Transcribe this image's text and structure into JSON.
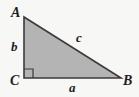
{
  "figure": {
    "kind": "right-triangle-diagram",
    "canvas": {
      "width": 139,
      "height": 97
    },
    "colors": {
      "background": "#f7f7f5",
      "triangle_fill": "#b4b4b4",
      "triangle_stroke": "#3a3a3a",
      "right_angle_stroke": "#3a3a3a",
      "label_text": "#1d1d1d"
    },
    "vertices": [
      {
        "name": "A",
        "label": "A",
        "x": 24,
        "y": 17,
        "position": "top-left-apex"
      },
      {
        "name": "B",
        "label": "B",
        "x": 121,
        "y": 78,
        "position": "bottom-right"
      },
      {
        "name": "C",
        "label": "C",
        "x": 24,
        "y": 78,
        "position": "bottom-left-right-angle"
      }
    ],
    "sides": [
      {
        "name": "a",
        "label": "a",
        "between": "C-B",
        "role": "horizontal-leg",
        "x": 70,
        "y": 83
      },
      {
        "name": "b",
        "label": "b",
        "between": "A-C",
        "role": "vertical-leg",
        "x": 12,
        "y": 42
      },
      {
        "name": "c",
        "label": "c",
        "between": "A-B",
        "role": "hypotenuse",
        "x": 77,
        "y": 33
      }
    ],
    "right_angle_marker": {
      "at_vertex": "C",
      "size": 9,
      "x": 24,
      "y": 78
    },
    "geometry": {
      "triangle_points": "24,17 121,78 24,78",
      "right_angle_points": "24,69 33,69 33,78",
      "stroke_width": 1.6,
      "right_angle_stroke_width": 1.2
    }
  }
}
